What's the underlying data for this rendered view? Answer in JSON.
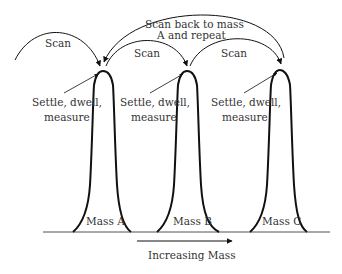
{
  "diagram": {
    "labels": {
      "scan_left": "Scan",
      "scan_ab": "Scan",
      "scan_bc": "Scan",
      "scan_back_line1": "Scan back to mass",
      "scan_back_line2": "A and repeat",
      "settle_a_line1": "Settle, dwell,",
      "settle_a_line2": "measure",
      "settle_b_line1": "Settle, dwell,",
      "settle_b_line2": "measure",
      "settle_c_line1": "Settle, dwell,",
      "settle_c_line2": "measure",
      "mass_a": "Mass A",
      "mass_b": "Mass B",
      "mass_c": "Mass C",
      "axis_label": "Increasing Mass"
    },
    "peaks": [
      "Mass A",
      "Mass B",
      "Mass C"
    ],
    "line_color": "#111111",
    "text_color": "#333333"
  }
}
